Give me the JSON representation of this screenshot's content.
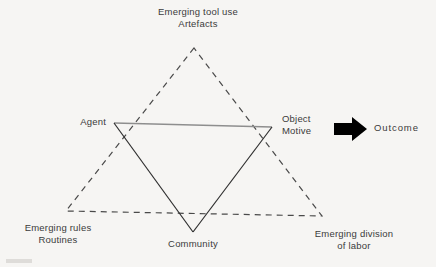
{
  "figure": {
    "type": "activity-system-triangle-diagram",
    "background_color": "#f6f5f3",
    "text_color": "#3b3b3b",
    "solid_line_color": "#2e2e2e",
    "light_line_color": "#8e8e8e",
    "dashed_line_color": "#4a4a4a",
    "arrow_color": "#000000",
    "nodes": {
      "top": "Emerging tool use\nArtefacts",
      "left": "Agent",
      "right": "Object\nMotive",
      "bottom_left": "Emerging rules\nRoutines",
      "bottom_center": "Community",
      "bottom_right": "Emerging division\nof labor",
      "outcome": "Outcome"
    },
    "icons": {
      "outcome_arrow": "right-arrow-icon"
    },
    "geometry": {
      "dashed_triangle": [
        [
          194,
          48
        ],
        [
          66,
          211
        ],
        [
          322,
          216
        ]
      ],
      "solid_triangle": [
        [
          114,
          123
        ],
        [
          272,
          127
        ],
        [
          193,
          232
        ]
      ]
    }
  }
}
